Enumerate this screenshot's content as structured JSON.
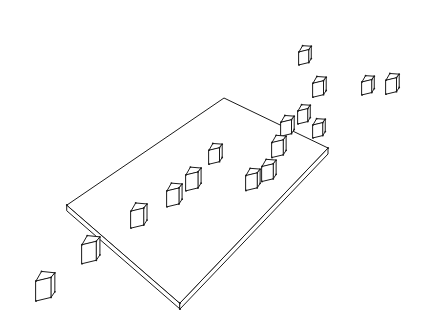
{
  "colors": {
    "ink": "#1a1a1a",
    "paper": "#ffffff"
  },
  "slab": {
    "top_face": [
      [
        67,
        205
      ],
      [
        224,
        98
      ],
      [
        328,
        148
      ],
      [
        180,
        303
      ]
    ],
    "thickness": 6
  },
  "cubes": [
    {
      "id": "cube-far-1",
      "x": 299,
      "y": 48,
      "s": 13,
      "on_slab": false
    },
    {
      "id": "cube-far-2",
      "x": 313,
      "y": 79,
      "s": 14,
      "on_slab": false
    },
    {
      "id": "cube-far-3",
      "x": 362,
      "y": 78,
      "s": 13,
      "on_slab": false
    },
    {
      "id": "cube-far-4",
      "x": 386,
      "y": 76,
      "s": 14,
      "on_slab": false
    },
    {
      "id": "cube-edge-1",
      "x": 298,
      "y": 107,
      "s": 13,
      "on_slab": true
    },
    {
      "id": "cube-edge-2",
      "x": 281,
      "y": 118,
      "s": 14,
      "on_slab": true
    },
    {
      "id": "cube-edge-3",
      "x": 313,
      "y": 121,
      "s": 13,
      "on_slab": true
    },
    {
      "id": "cube-mid-1",
      "x": 272,
      "y": 138,
      "s": 15,
      "on_slab": true
    },
    {
      "id": "cube-mid-2",
      "x": 262,
      "y": 162,
      "s": 15,
      "on_slab": true
    },
    {
      "id": "cube-mid-3",
      "x": 246,
      "y": 171,
      "s": 15,
      "on_slab": true
    },
    {
      "id": "cube-row-1",
      "x": 209,
      "y": 146,
      "s": 14,
      "on_slab": true
    },
    {
      "id": "cube-row-2",
      "x": 186,
      "y": 170,
      "s": 16,
      "on_slab": true
    },
    {
      "id": "cube-row-3",
      "x": 167,
      "y": 186,
      "s": 16,
      "on_slab": true
    },
    {
      "id": "cube-row-4",
      "x": 131,
      "y": 206,
      "s": 17,
      "on_slab": true
    },
    {
      "id": "cube-out-1",
      "x": 82,
      "y": 239,
      "s": 19,
      "on_slab": false
    },
    {
      "id": "cube-out-2",
      "x": 36,
      "y": 275,
      "s": 20,
      "on_slab": false
    }
  ]
}
